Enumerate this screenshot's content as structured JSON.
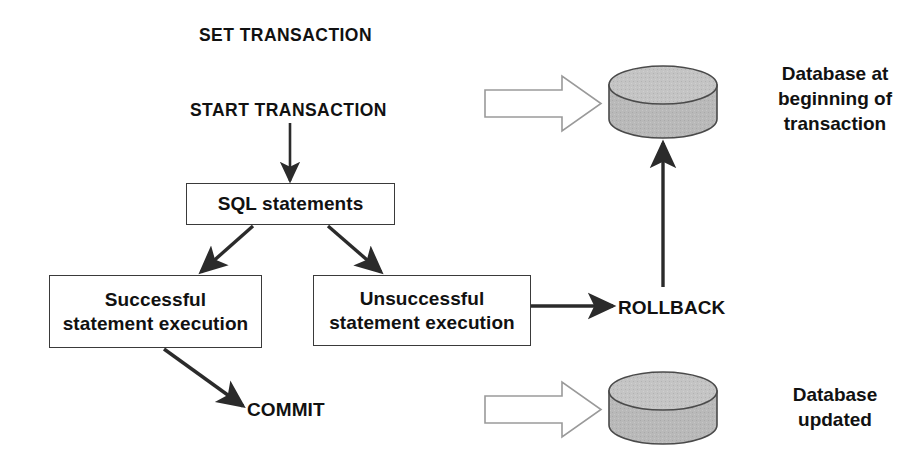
{
  "diagram": {
    "title_keyword": "SET TRANSACTION",
    "start_keyword": "START TRANSACTION",
    "nodes": {
      "sql_statements": "SQL statements",
      "successful_line1": "Successful",
      "successful_line2": "statement execution",
      "unsuccessful_line1": "Unsuccessful",
      "unsuccessful_line2": "statement execution"
    },
    "keywords": {
      "rollback": "ROLLBACK",
      "commit": "COMMIT"
    },
    "captions": {
      "database_top": "Database at\nbeginning of\ntransaction",
      "database_bottom": "Database\nupdated"
    },
    "colors": {
      "stroke": "#2b2b2b",
      "box_border": "#3a3a3a",
      "cylinder_fill": "#b9b9b9",
      "cylinder_top_fill": "#c3c3c3",
      "cylinder_stroke": "#4a4a4a",
      "block_arrow_stroke": "#9a9a9a",
      "text": "#111111",
      "background": "#ffffff"
    }
  }
}
